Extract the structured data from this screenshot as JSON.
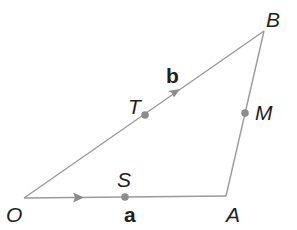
{
  "diagram": {
    "type": "vector-triangle",
    "colors": {
      "line": "#9a9a9a",
      "point": "#8c8c8c",
      "text": "#231f20",
      "background": "#ffffff"
    },
    "vertices": [
      {
        "id": "O",
        "label": "O",
        "x": 24,
        "y": 198
      },
      {
        "id": "A",
        "label": "A",
        "x": 226,
        "y": 196
      },
      {
        "id": "B",
        "label": "B",
        "x": 264,
        "y": 31
      }
    ],
    "points": [
      {
        "id": "S",
        "label": "S",
        "on": "OA"
      },
      {
        "id": "T",
        "label": "T",
        "on": "OB"
      },
      {
        "id": "M",
        "label": "M",
        "on": "AB"
      }
    ],
    "vectors": [
      {
        "from": "O",
        "to": "A",
        "label": "a"
      },
      {
        "from": "O",
        "to": "B",
        "label": "b"
      }
    ]
  },
  "labels": {
    "O": "O",
    "A": "A",
    "B": "B",
    "S": "S",
    "T": "T",
    "M": "M",
    "vec_a": "a",
    "vec_b": "b"
  }
}
